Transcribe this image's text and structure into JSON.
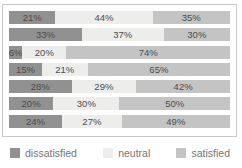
{
  "chart_data": {
    "type": "bar",
    "subtype": "stacked-horizontal-100pct",
    "unit": "%",
    "xlim": [
      0,
      100
    ],
    "grid": false,
    "legend_position": "bottom",
    "series": [
      {
        "name": "dissatisfied",
        "color": "#919191",
        "values": [
          21,
          33,
          6,
          15,
          28,
          20,
          24
        ]
      },
      {
        "name": "neutral",
        "color": "#ededec",
        "values": [
          44,
          37,
          20,
          21,
          29,
          30,
          27
        ]
      },
      {
        "name": "satisfied",
        "color": "#c4c4c4",
        "values": [
          35,
          30,
          74,
          65,
          42,
          50,
          49
        ]
      }
    ],
    "data_labels": [
      [
        "21%",
        "44%",
        "35%"
      ],
      [
        "33%",
        "37%",
        "30%"
      ],
      [
        "6%",
        "20%",
        "74%"
      ],
      [
        "15%",
        "21%",
        "65%"
      ],
      [
        "28%",
        "29%",
        "42%"
      ],
      [
        "20%",
        "30%",
        "50%"
      ],
      [
        "24%",
        "27%",
        "49%"
      ]
    ]
  },
  "legend": {
    "items": [
      {
        "label": "dissatisfied",
        "color": "#919191"
      },
      {
        "label": "neutral",
        "color": "#ededec"
      },
      {
        "label": "satisfied",
        "color": "#c4c4c4"
      }
    ]
  },
  "colors": {
    "frame_border": "#c9c9c9",
    "bar_label_text": "#4c4c4c",
    "legend_text": "#757575",
    "background": "#ffffff"
  }
}
